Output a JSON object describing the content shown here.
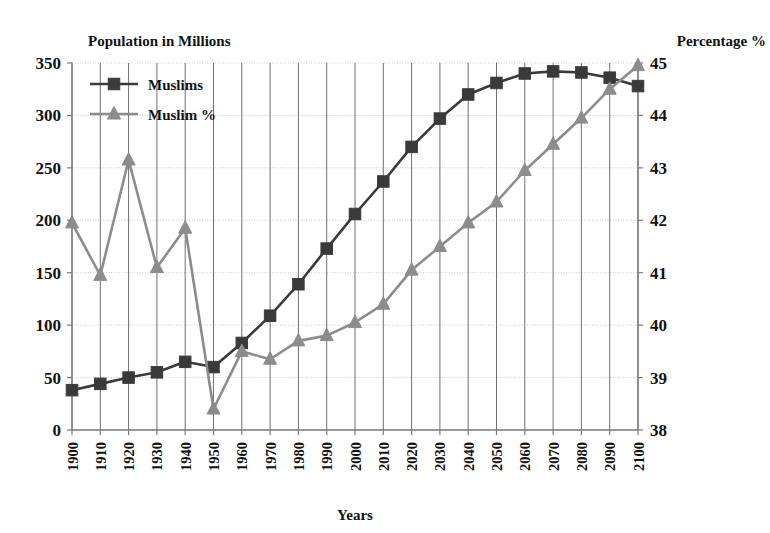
{
  "chart_data": {
    "type": "line",
    "title": "",
    "xlabel": "Years",
    "left_axis_title": "Population in Millions",
    "right_axis_title": "Percentage %",
    "grid": true,
    "legend_position": "top-left",
    "x": [
      1900,
      1910,
      1920,
      1930,
      1940,
      1950,
      1960,
      1970,
      1980,
      1990,
      2000,
      2010,
      2020,
      2030,
      2040,
      2050,
      2060,
      2070,
      2080,
      2090,
      2100
    ],
    "categories": [
      "1900",
      "1910",
      "1920",
      "1930",
      "1940",
      "1950",
      "1960",
      "1970",
      "1980",
      "1990",
      "2000",
      "2010",
      "2020",
      "2030",
      "2040",
      "2050",
      "2060",
      "2070",
      "2080",
      "2090",
      "2100"
    ],
    "xlim": [
      1900,
      2100
    ],
    "left_ylim": [
      0,
      350
    ],
    "left_yticks": [
      0,
      50,
      100,
      150,
      200,
      250,
      300,
      350
    ],
    "left_ytick_labels": [
      "0",
      "50",
      "100",
      "150",
      "200",
      "250",
      "300",
      "350"
    ],
    "right_ylim": [
      38,
      45
    ],
    "right_yticks": [
      38,
      39,
      40,
      41,
      42,
      43,
      44,
      45
    ],
    "right_ytick_labels": [
      "38",
      "39",
      "40",
      "41",
      "42",
      "43",
      "44",
      "45"
    ],
    "series": [
      {
        "name": "Muslims",
        "axis": "left",
        "unit": "millions",
        "color": "#3a3a3a",
        "marker": "square",
        "values": [
          38,
          44,
          50,
          55,
          65,
          60,
          83,
          109,
          139,
          173,
          206,
          237,
          270,
          297,
          320,
          331,
          340,
          342,
          341,
          336,
          328
        ]
      },
      {
        "name": "Muslim %",
        "axis": "right",
        "unit": "percent",
        "color": "#8c8c8c",
        "marker": "triangle",
        "values": [
          41.95,
          40.95,
          43.15,
          41.1,
          41.85,
          38.4,
          39.5,
          39.35,
          39.7,
          39.8,
          40.05,
          40.4,
          41.05,
          41.5,
          41.95,
          42.35,
          42.95,
          43.45,
          43.95,
          44.5,
          44.95
        ]
      }
    ]
  },
  "legend": {
    "entries": [
      {
        "label": "Muslims",
        "color": "#3a3a3a",
        "marker": "square"
      },
      {
        "label": "Muslim %",
        "color": "#8c8c8c",
        "marker": "triangle"
      }
    ]
  },
  "labels": {
    "left_axis_title": "Population in Millions",
    "right_axis_title": "Percentage %",
    "x_axis_title": "Years"
  }
}
